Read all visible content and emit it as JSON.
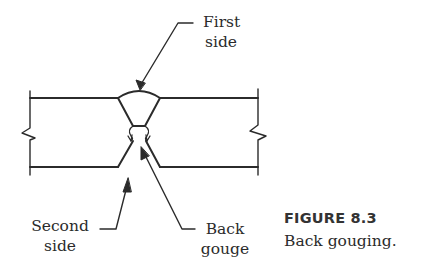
{
  "figure": {
    "labels": {
      "first_side": [
        "First",
        "side"
      ],
      "second_side": [
        "Second",
        "side"
      ],
      "back_gouge": [
        "Back",
        "gouge"
      ]
    },
    "caption": {
      "number": "FIGURE 8.3",
      "text": "Back gouging."
    }
  },
  "colors": {
    "line": "#2b2b2b",
    "background": "#ffffff"
  }
}
